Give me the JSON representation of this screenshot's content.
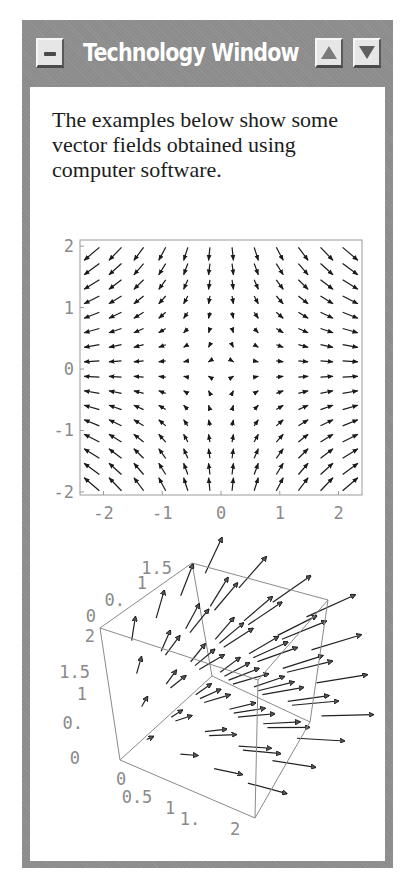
{
  "window": {
    "title": "Technology Window",
    "buttons": {
      "minimize": "minus-icon",
      "scroll_up": "triangle-up-icon",
      "scroll_down": "triangle-down-icon"
    },
    "colors": {
      "frame": "#8c8c8c",
      "button_face": "#e6e6e6",
      "title_text": "#ffffff"
    }
  },
  "content": {
    "intro_text": "The examples below show some vector fields obtained using computer software."
  },
  "chart_data": [
    {
      "type": "vector_field_2d",
      "title": "",
      "field": "F(x,y) = (x, -y)",
      "xlabel": "",
      "ylabel": "",
      "xlim": [
        -2.4,
        2.4
      ],
      "ylim": [
        -2.05,
        2.1
      ],
      "x_ticks": [
        "-2",
        "-1",
        "0",
        "1",
        "2"
      ],
      "y_ticks": [
        "2",
        "1",
        "0",
        "-1",
        "-2"
      ],
      "x_tick_values": [
        -2,
        -1,
        0,
        1,
        2
      ],
      "y_tick_values": [
        2,
        1,
        0,
        -1,
        -2
      ],
      "grid_x": [
        -2.25,
        -1.75,
        -1.25,
        -0.75,
        -0.25,
        0.25,
        0.75,
        1.25,
        1.75,
        2.25
      ],
      "grid_y": [
        1.875,
        1.625,
        1.375,
        1.125,
        0.875,
        0.625,
        0.375,
        0.125,
        -0.125,
        -0.375,
        -0.625,
        -0.875,
        -1.125,
        -1.375,
        -1.625,
        -1.875
      ],
      "grid_x_full": [
        -2.2,
        -1.8,
        -1.4,
        -1.0,
        -0.6,
        -0.2,
        0.2,
        0.6,
        1.0,
        1.4,
        1.8,
        2.2
      ],
      "grid": false
    },
    {
      "type": "vector_field_3d",
      "title": "",
      "box": {
        "x": [
          0,
          2
        ],
        "y": [
          0,
          1.5
        ],
        "z": [
          0,
          2
        ]
      },
      "tick_labels_bottom_x": [
        "0",
        "0.5",
        "1",
        "1.",
        "2"
      ],
      "tick_labels_vertical_z": [
        "0",
        "0.",
        "1",
        "1.5",
        "2"
      ],
      "tick_labels_top_y": [
        "0",
        "0.",
        "1",
        "1.5"
      ],
      "description": "Arrows grow in length away from origin, pointing up and to the right"
    }
  ]
}
